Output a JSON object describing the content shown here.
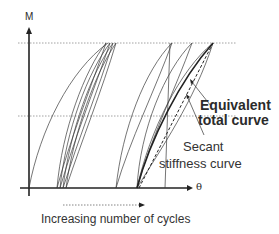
{
  "diagram": {
    "type": "moment-rotation cyclic loading schematic",
    "axes": {
      "y_label": "M",
      "x_label": "θ"
    },
    "annotations": {
      "equivalent_line1": "Equivalent",
      "equivalent_line2": "total curve",
      "secant_line1": "Secant",
      "secant_line2": "stiffness curve",
      "cycles_caption": "Increasing number of cycles"
    },
    "reference_lines": [
      "upper dotted moment level",
      "lower dotted moment level"
    ],
    "colors": {
      "curve": "#3a3a3a",
      "axis": "#222222",
      "dotted": "#888888",
      "text": "#2b2b2b"
    }
  }
}
